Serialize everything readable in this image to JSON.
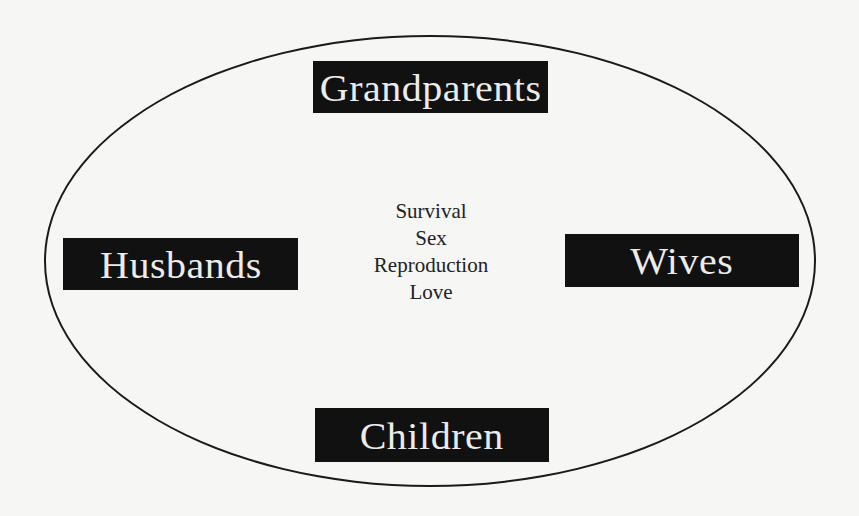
{
  "diagram": {
    "type": "ellipse-with-labeled-boxes",
    "colors": {
      "background": "#f6f6f4",
      "ellipse_stroke": "#1a1a1a",
      "box_fill": "#111111",
      "box_text": "#ececec",
      "center_text": "#222222"
    },
    "boxes": {
      "top": "Grandparents",
      "left": "Husbands",
      "right": "Wives",
      "bottom": "Children"
    },
    "center_lines": [
      "Survival",
      "Sex",
      "Reproduction",
      "Love"
    ]
  }
}
